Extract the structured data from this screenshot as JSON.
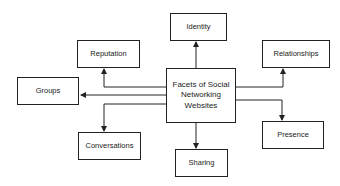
{
  "diagram": {
    "center": {
      "label": "Facets of Social\nNetworking\nWebsites"
    },
    "nodes": [
      {
        "id": "identity",
        "label": "Identity"
      },
      {
        "id": "reputation",
        "label": "Reputation"
      },
      {
        "id": "relationships",
        "label": "Relationships"
      },
      {
        "id": "groups",
        "label": "Groups"
      },
      {
        "id": "presence",
        "label": "Presence"
      },
      {
        "id": "conversations",
        "label": "Conversations"
      },
      {
        "id": "sharing",
        "label": "Sharing"
      }
    ],
    "colors": {
      "line": "#222222",
      "background": "#ffffff"
    }
  }
}
